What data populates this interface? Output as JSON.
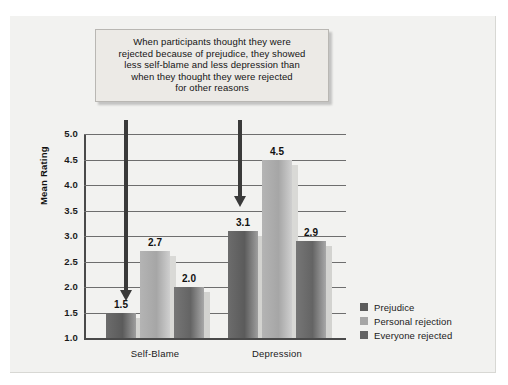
{
  "callout": {
    "lines": [
      "When participants thought they were",
      "rejected because of prejudice, they showed",
      "less self-blame and less depression than",
      "when they thought they were rejected",
      "for other reasons"
    ]
  },
  "chart_data": {
    "type": "bar",
    "title": "",
    "xlabel": "",
    "ylabel": "Mean Rating",
    "ylim": [
      1.0,
      5.0
    ],
    "ytick_step": 0.5,
    "yticks": [
      "5.0",
      "4.5",
      "4.0",
      "3.5",
      "3.0",
      "2.5",
      "2.0",
      "1.5",
      "1.0"
    ],
    "grid": true,
    "legend_position": "right",
    "categories": [
      "Self-Blame",
      "Depression"
    ],
    "series": [
      {
        "name": "Prejudice",
        "values": [
          1.5,
          3.1
        ],
        "color": "#5b5b5b"
      },
      {
        "name": "Personal rejection",
        "values": [
          2.7,
          4.5
        ],
        "color": "#a6a6a6"
      },
      {
        "name": "Everyone rejected",
        "values": [
          2.0,
          2.9
        ],
        "color": "#646464"
      }
    ],
    "value_labels": [
      "1.5",
      "2.7",
      "2.0",
      "3.1",
      "4.5",
      "2.9"
    ],
    "annotations": [
      {
        "name": "arrow-to-self-blame-prejudice",
        "target": "Self-Blame / Prejudice"
      },
      {
        "name": "arrow-to-depression-prejudice",
        "target": "Depression / Prejudice"
      }
    ]
  }
}
